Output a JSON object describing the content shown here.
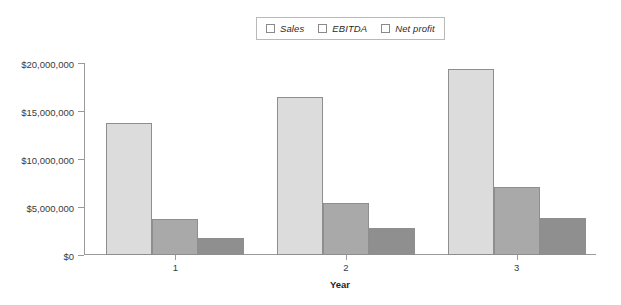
{
  "chart_data": {
    "type": "bar",
    "title": "",
    "subtitle": "",
    "xlabel": "Year",
    "ylabel": "",
    "categories": [
      "1",
      "2",
      "3"
    ],
    "series": [
      {
        "name": "Sales",
        "values": [
          13800000,
          16500000,
          19400000
        ],
        "color": "#dcdcdc"
      },
      {
        "name": "EBITDA",
        "values": [
          3700000,
          5400000,
          7100000
        ],
        "color": "#a9a9a9"
      },
      {
        "name": "Net profit",
        "values": [
          1750000,
          2800000,
          3850000
        ],
        "color": "#8f8f8f"
      }
    ],
    "ylim": [
      0,
      20000000
    ],
    "yticks": [
      0,
      5000000,
      10000000,
      15000000,
      20000000
    ],
    "ytick_labels": [
      "$0",
      "$5,000,000",
      "$10,000,000",
      "$15,000,000",
      "$20,000,000"
    ],
    "xtick_labels": [
      "1",
      "2",
      "3"
    ],
    "grid": false,
    "legend_position": "top-center",
    "legend_entries": [
      "Sales",
      "EBITDA",
      "Net profit"
    ],
    "annotations": []
  },
  "legend": {
    "items": [
      {
        "label": "Sales"
      },
      {
        "label": "EBITDA"
      },
      {
        "label": "Net profit"
      }
    ]
  },
  "axes": {
    "y": {
      "ticks": [
        {
          "label": "$20,000,000",
          "value": 20000000
        },
        {
          "label": "$15,000,000",
          "value": 15000000
        },
        {
          "label": "$10,000,000",
          "value": 10000000
        },
        {
          "label": "$5,000,000",
          "value": 5000000
        },
        {
          "label": "$0",
          "value": 0
        }
      ]
    },
    "x": {
      "title": "Year",
      "ticks": [
        {
          "label": "1"
        },
        {
          "label": "2"
        },
        {
          "label": "3"
        }
      ]
    }
  }
}
